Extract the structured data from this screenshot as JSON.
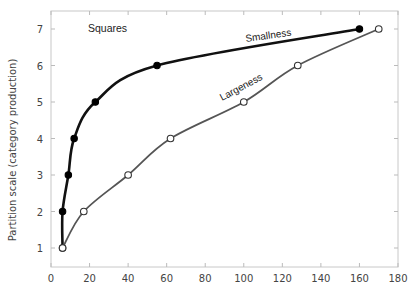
{
  "chart_data": {
    "type": "line",
    "title": "",
    "panel_label": "Squares",
    "xlabel": "",
    "ylabel": "Partition scale (category production)",
    "xlim": [
      0,
      180
    ],
    "ylim": [
      0.5,
      7.5
    ],
    "x_ticks": [
      0,
      20,
      40,
      60,
      80,
      100,
      120,
      140,
      160,
      180
    ],
    "y_ticks": [
      1,
      2,
      3,
      4,
      5,
      6,
      7
    ],
    "grid": false,
    "legend": "inline labels on curves",
    "series": [
      {
        "name": "Smallness",
        "marker": "filled-circle",
        "color": "#111111",
        "points": [
          [
            6,
            1
          ],
          [
            6,
            2
          ],
          [
            9,
            3
          ],
          [
            12,
            4
          ],
          [
            23,
            5
          ],
          [
            55,
            6
          ],
          [
            160,
            7
          ]
        ]
      },
      {
        "name": "Largeness",
        "marker": "open-circle",
        "color": "#555555",
        "points": [
          [
            6,
            1
          ],
          [
            17,
            2
          ],
          [
            40,
            3
          ],
          [
            62,
            4
          ],
          [
            100,
            5
          ],
          [
            128,
            6
          ],
          [
            170,
            7
          ]
        ]
      }
    ]
  }
}
